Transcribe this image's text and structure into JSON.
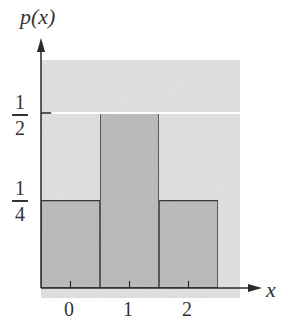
{
  "chart_data": {
    "type": "bar",
    "title": "",
    "xlabel": "x",
    "ylabel": "p(x)",
    "categories": [
      "0",
      "1",
      "2"
    ],
    "values": [
      0.25,
      0.5,
      0.25
    ],
    "yticks": [
      {
        "value": 0.25,
        "num": "1",
        "den": "4"
      },
      {
        "value": 0.5,
        "num": "1",
        "den": "2"
      }
    ],
    "ylim": [
      0,
      0.65
    ],
    "grid": false,
    "legend": null,
    "colors": {
      "background_panel": "#e2e2e2",
      "bar_fill": "#bdbdbd",
      "bar_edge": "#3a3a3a",
      "axis": "#2a2a2a",
      "half_line": "#ffffff"
    }
  },
  "labels": {
    "ylabel": "p(x)",
    "xlabel": "x",
    "ytick_half_num": "1",
    "ytick_half_den": "2",
    "ytick_quarter_num": "1",
    "ytick_quarter_den": "4",
    "xtick_0": "0",
    "xtick_1": "1",
    "xtick_2": "2"
  }
}
